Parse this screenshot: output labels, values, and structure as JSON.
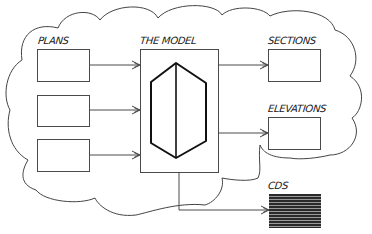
{
  "diagram": {
    "title": "",
    "colors": {
      "line": "#4a4a4a",
      "model_outline": "#111111",
      "cds_fill": "#2a2a2a",
      "background": "#ffffff"
    },
    "cloud": {
      "label": "",
      "shape": "cloud-outline"
    },
    "inputs": {
      "label": "PLANS",
      "boxes": [
        {
          "id": "plan-1"
        },
        {
          "id": "plan-2"
        },
        {
          "id": "plan-3"
        }
      ]
    },
    "model": {
      "label": "THE MODEL",
      "icon": "hexagonal-prism-icon"
    },
    "outputs": [
      {
        "id": "sections",
        "label": "SECTIONS"
      },
      {
        "id": "elevations",
        "label": "ELEVATIONS"
      },
      {
        "id": "cds",
        "label": "CDS",
        "style": "striped-filled"
      }
    ],
    "edges": [
      {
        "from": "plan-1",
        "to": "model"
      },
      {
        "from": "plan-2",
        "to": "model"
      },
      {
        "from": "plan-3",
        "to": "model"
      },
      {
        "from": "model",
        "to": "sections"
      },
      {
        "from": "model",
        "to": "elevations"
      },
      {
        "from": "model",
        "to": "cds"
      }
    ]
  }
}
